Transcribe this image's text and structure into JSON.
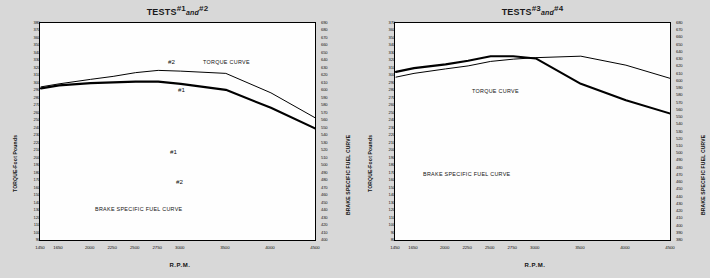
{
  "page": {
    "background_color": "#d8d8d8",
    "panel_color": "#fefefe",
    "ink_color": "#000000"
  },
  "charts": [
    {
      "id": "tests-1-and-2",
      "title_prefix": "TESTS",
      "title_a": "#1",
      "title_conj": "and",
      "title_b": "#2",
      "title_full": "TESTS #1 and #2",
      "xlabel": "R.P.M.",
      "ylabel_left": "TORQUE-Foot Pounds",
      "ylabel_right": "BRAKE SPECIFIC FUEL CURVE",
      "annotations": {
        "torque": "TORQUE CURVE",
        "fuel": "BRAKE SPECIFIC FUEL CURVE",
        "torque_upper": "#2",
        "torque_lower": "#1",
        "fuel_upper": "#1",
        "fuel_lower": "#2"
      }
    },
    {
      "id": "tests-3-and-4",
      "title_prefix": "TESTS",
      "title_a": "#3",
      "title_conj": "and",
      "title_b": "#4",
      "title_full": "TESTS #3 and #4",
      "xlabel": "R.P.M.",
      "ylabel_left": "TORQUE-Foot Pounds",
      "ylabel_right": "BRAKE SPECIFIC FUEL CURVE",
      "annotations": {
        "torque": "TORQUE CURVE",
        "fuel": "BRAKE SPECIFIC FUEL CURVE",
        "torque_upper": "#3",
        "torque_lower": "#4",
        "fuel_upper": "#3",
        "fuel_lower": "#4"
      }
    }
  ],
  "chart_data": [
    {
      "type": "line",
      "id": "tests-1-and-2",
      "title": "TESTS #1 and #2",
      "xlabel": "R.P.M.",
      "ylabel": "TORQUE-Foot Pounds",
      "ylabel_secondary": "BRAKE SPECIFIC FUEL CURVE",
      "grid": false,
      "legend": "inline-annotations",
      "x": [
        1450,
        1650,
        2000,
        2250,
        2500,
        2750,
        3000,
        3500,
        4000,
        4500
      ],
      "xtick_labels": [
        "1450",
        "1650",
        "2000",
        "2250",
        "2500",
        "2750",
        "3000",
        "3500",
        "4000",
        "4500"
      ],
      "ylim": [
        90,
        380
      ],
      "ytick_labels": [
        "380",
        "370",
        "360",
        "350",
        "340",
        "330",
        "320",
        "310",
        "300",
        "290",
        "280",
        "270",
        "260",
        "250",
        "240",
        "230",
        "220",
        "210",
        "200",
        "190",
        "180",
        "170",
        "160",
        "150",
        "140",
        "130",
        "120",
        "110",
        "100",
        "90"
      ],
      "ylim_secondary": [
        400,
        690
      ],
      "ytick_labels_secondary": [
        "690",
        "680",
        "670",
        "660",
        "650",
        "640",
        "630",
        "620",
        "610",
        "600",
        "590",
        "580",
        "570",
        "560",
        "550",
        "540",
        "530",
        "520",
        "510",
        "500",
        "490",
        "480",
        "470",
        "460",
        "450",
        "440",
        "430",
        "420",
        "410",
        "400"
      ],
      "series": [
        {
          "name": "#2",
          "axis": "left",
          "kind": "torque",
          "style": "solid-thin",
          "values": [
            296,
            300,
            306,
            310,
            315,
            318,
            317,
            314,
            288,
            254
          ]
        },
        {
          "name": "#1",
          "axis": "left",
          "kind": "torque",
          "style": "solid-bold",
          "values": [
            294,
            298,
            301,
            302,
            303,
            303,
            300,
            292,
            268,
            240
          ]
        },
        {
          "name": "#1",
          "axis": "right",
          "kind": "brake-specific-fuel",
          "style": "dashed-bold",
          "values": [
            150,
            156,
            163,
            170,
            185,
            196,
            205,
            240,
            288,
            345
          ]
        },
        {
          "name": "#2",
          "axis": "right",
          "kind": "brake-specific-fuel",
          "style": "dashed-thin",
          "values": [
            148,
            153,
            160,
            162,
            172,
            182,
            192,
            224,
            268,
            318
          ]
        }
      ]
    },
    {
      "type": "line",
      "id": "tests-3-and-4",
      "title": "TESTS #3 and #4",
      "xlabel": "R.P.M.",
      "ylabel": "TORQUE-Foot Pounds",
      "ylabel_secondary": "BRAKE SPECIFIC FUEL CURVE",
      "grid": false,
      "legend": "inline-annotations",
      "x": [
        1450,
        1650,
        2000,
        2250,
        2500,
        2750,
        3000,
        3500,
        4000,
        4500
      ],
      "xtick_labels": [
        "1450",
        "1650",
        "2000",
        "2250",
        "2500",
        "2750",
        "3000",
        "3500",
        "4000",
        "4500"
      ],
      "ylim": [
        80,
        370
      ],
      "ytick_labels": [
        "370",
        "360",
        "350",
        "340",
        "330",
        "320",
        "310",
        "300",
        "290",
        "280",
        "270",
        "260",
        "250",
        "240",
        "230",
        "220",
        "210",
        "200",
        "190",
        "180",
        "170",
        "160",
        "150",
        "140",
        "130",
        "120",
        "110",
        "100",
        "90",
        "80"
      ],
      "ylim_secondary": [
        380,
        680
      ],
      "ytick_labels_secondary": [
        "680",
        "670",
        "660",
        "650",
        "640",
        "630",
        "620",
        "610",
        "600",
        "590",
        "580",
        "570",
        "560",
        "550",
        "540",
        "530",
        "520",
        "510",
        "500",
        "490",
        "480",
        "470",
        "460",
        "450",
        "440",
        "430",
        "420",
        "410",
        "400",
        "390",
        "380"
      ],
      "series": [
        {
          "name": "#3",
          "axis": "left",
          "kind": "torque",
          "style": "solid-bold",
          "values": [
            306,
            311,
            316,
            321,
            327,
            327,
            324,
            290,
            268,
            250
          ]
        },
        {
          "name": "#4",
          "axis": "left",
          "kind": "torque",
          "style": "solid-thin",
          "values": [
            299,
            304,
            310,
            314,
            320,
            323,
            325,
            327,
            315,
            297
          ]
        },
        {
          "name": "#3",
          "axis": "right",
          "kind": "brake-specific-fuel",
          "style": "dashed-bold",
          "values": [
            133,
            140,
            152,
            153,
            166,
            183,
            206,
            245,
            271,
            298
          ]
        },
        {
          "name": "#4",
          "axis": "right",
          "kind": "brake-specific-fuel",
          "style": "dashed-thin",
          "values": [
            90,
            101,
            130,
            113,
            122,
            143,
            163,
            188,
            247,
            323
          ]
        }
      ]
    }
  ]
}
